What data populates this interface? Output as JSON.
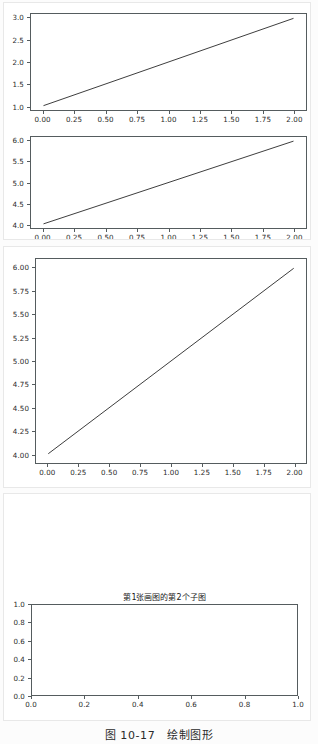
{
  "document": {
    "caption": "图 10-17　绘制图形"
  },
  "figures": [
    {
      "name": "figure-1",
      "subplots": [
        {
          "name": "subplot-1-1",
          "title": "",
          "chart": {
            "type": "line",
            "title": "",
            "xlabel": "",
            "ylabel": "",
            "xlim": [
              -0.1,
              2.1
            ],
            "ylim": [
              0.9,
              3.1
            ],
            "xticks": [
              "0.00",
              "0.25",
              "0.50",
              "0.75",
              "1.00",
              "1.25",
              "1.50",
              "1.75",
              "2.00"
            ],
            "xtickvalues": [
              0.0,
              0.25,
              0.5,
              0.75,
              1.0,
              1.25,
              1.5,
              1.75,
              2.0
            ],
            "yticks": [
              "1.0",
              "1.5",
              "2.0",
              "2.5",
              "3.0"
            ],
            "ytickvalues": [
              1.0,
              1.5,
              2.0,
              2.5,
              3.0
            ],
            "grid": false,
            "legend": null,
            "series": [
              {
                "name": "series-1",
                "color": "#3b3b3b",
                "x": [
                  0.0,
                  2.0
                ],
                "y": [
                  1.0,
                  3.0
                ]
              }
            ]
          }
        },
        {
          "name": "subplot-1-2",
          "title": "",
          "chart": {
            "type": "line",
            "title": "",
            "xlabel": "",
            "ylabel": "",
            "xlim": [
              -0.1,
              2.1
            ],
            "ylim": [
              3.9,
              6.1
            ],
            "xticks": [
              "0.00",
              "0.25",
              "0.50",
              "0.75",
              "1.00",
              "1.25",
              "1.50",
              "1.75",
              "2.00"
            ],
            "xtickvalues": [
              0.0,
              0.25,
              0.5,
              0.75,
              1.0,
              1.25,
              1.5,
              1.75,
              2.0
            ],
            "yticks": [
              "4.0",
              "4.5",
              "5.0",
              "5.5",
              "6.0"
            ],
            "ytickvalues": [
              4.0,
              4.5,
              5.0,
              5.5,
              6.0
            ],
            "grid": false,
            "legend": null,
            "series": [
              {
                "name": "series-1",
                "color": "#3b3b3b",
                "x": [
                  0.0,
                  2.0
                ],
                "y": [
                  4.0,
                  6.0
                ]
              }
            ]
          }
        }
      ]
    },
    {
      "name": "figure-2",
      "subplots": [
        {
          "name": "subplot-2-1",
          "title": "",
          "chart": {
            "type": "line",
            "title": "",
            "xlabel": "",
            "ylabel": "",
            "xlim": [
              -0.1,
              2.1
            ],
            "ylim": [
              3.9,
              6.1
            ],
            "xticks": [
              "0.00",
              "0.25",
              "0.50",
              "0.75",
              "1.00",
              "1.25",
              "1.50",
              "1.75",
              "2.00"
            ],
            "xtickvalues": [
              0.0,
              0.25,
              0.5,
              0.75,
              1.0,
              1.25,
              1.5,
              1.75,
              2.0
            ],
            "yticks": [
              "4.00",
              "4.25",
              "4.50",
              "4.75",
              "5.00",
              "5.25",
              "5.50",
              "5.75",
              "6.00"
            ],
            "ytickvalues": [
              4.0,
              4.25,
              4.5,
              4.75,
              5.0,
              5.25,
              5.5,
              5.75,
              6.0
            ],
            "grid": false,
            "legend": null,
            "series": [
              {
                "name": "series-1",
                "color": "#3b3b3b",
                "x": [
                  0.0,
                  2.0
                ],
                "y": [
                  4.0,
                  6.0
                ]
              }
            ]
          }
        }
      ]
    },
    {
      "name": "figure-3",
      "subplots": [
        {
          "name": "subplot-3-1",
          "title": "第1张画图的第2个子图",
          "chart": {
            "type": "line",
            "title": "第1张画图的第2个子图",
            "xlabel": "",
            "ylabel": "",
            "xlim": [
              0.0,
              1.0
            ],
            "ylim": [
              0.0,
              1.0
            ],
            "xticks": [
              "0.0",
              "0.2",
              "0.4",
              "0.6",
              "0.8",
              "1.0"
            ],
            "xtickvalues": [
              0.0,
              0.2,
              0.4,
              0.6,
              0.8,
              1.0
            ],
            "yticks": [
              "0.0",
              "0.2",
              "0.4",
              "0.6",
              "0.8",
              "1.0"
            ],
            "ytickvalues": [
              0.0,
              0.2,
              0.4,
              0.6,
              0.8,
              1.0
            ],
            "grid": false,
            "legend": null,
            "series": []
          }
        }
      ]
    }
  ]
}
